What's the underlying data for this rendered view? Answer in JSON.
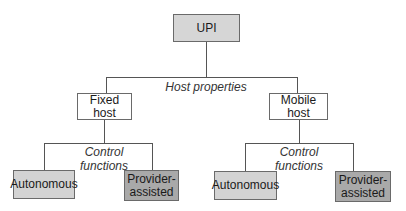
{
  "diagram": {
    "type": "tree",
    "root": {
      "label": "UPI",
      "color": "#d6d6d6"
    },
    "level1_edge_label": "Host properties",
    "hosts": [
      {
        "label": "Fixed host",
        "edge_label": "Control functions",
        "edge_label_lines": [
          "Control",
          "functions"
        ],
        "children": [
          {
            "label": "Autonomous",
            "color": "#d3d3d3"
          },
          {
            "label": "Provider-assisted",
            "lines": [
              "Provider-",
              "assisted"
            ],
            "color": "#a9a9a9"
          }
        ]
      },
      {
        "label": "Mobile host",
        "edge_label": "Control functions",
        "edge_label_lines": [
          "Control",
          "functions"
        ],
        "children": [
          {
            "label": "Autonomous",
            "color": "#d3d3d3"
          },
          {
            "label": "Provider-assisted",
            "lines": [
              "Provider-",
              "assisted"
            ],
            "color": "#a9a9a9"
          }
        ]
      }
    ]
  }
}
